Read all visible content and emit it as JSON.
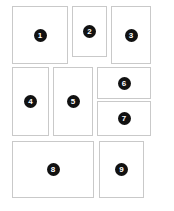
{
  "diagram": {
    "canvas": {
      "width": 174,
      "height": 211,
      "background": "#ffffff"
    },
    "style": {
      "panel_fill": "#ffffff",
      "panel_border": "#c9c9c9",
      "badge_fill": "#111111",
      "badge_text": "#ffffff"
    },
    "panels": [
      {
        "label": "1",
        "x": 12,
        "y": 6,
        "w": 56,
        "h": 58
      },
      {
        "label": "2",
        "x": 72,
        "y": 6,
        "w": 35,
        "h": 51
      },
      {
        "label": "3",
        "x": 111,
        "y": 6,
        "w": 40,
        "h": 58
      },
      {
        "label": "4",
        "x": 12,
        "y": 67,
        "w": 37,
        "h": 69
      },
      {
        "label": "5",
        "x": 53,
        "y": 67,
        "w": 40,
        "h": 69
      },
      {
        "label": "6",
        "x": 97,
        "y": 67,
        "w": 54,
        "h": 32
      },
      {
        "label": "7",
        "x": 97,
        "y": 101,
        "w": 54,
        "h": 35
      },
      {
        "label": "8",
        "x": 12,
        "y": 141,
        "w": 82,
        "h": 57
      },
      {
        "label": "9",
        "x": 99,
        "y": 141,
        "w": 45,
        "h": 57
      }
    ]
  }
}
